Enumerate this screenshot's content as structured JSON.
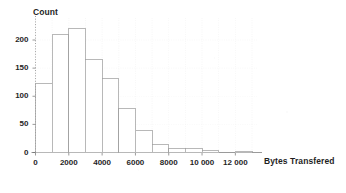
{
  "chart_data": {
    "type": "bar",
    "title": "",
    "xlabel": "Bytes Transfered",
    "ylabel": "Count",
    "bin_width": 1000,
    "grid": true,
    "legend": false,
    "xlim": [
      -600,
      13600
    ],
    "ylim": [
      0,
      232
    ],
    "bin_starts": [
      0,
      1000,
      2000,
      3000,
      4000,
      5000,
      6000,
      7000,
      8000,
      9000,
      10000,
      11000,
      12000
    ],
    "bin_ends": [
      1000,
      2000,
      3000,
      4000,
      5000,
      6000,
      7000,
      8000,
      9000,
      10000,
      11000,
      12000,
      13000
    ],
    "categories": [
      "0-1000",
      "1000-2000",
      "2000-3000",
      "3000-4000",
      "4000-5000",
      "5000-6000",
      "6000-7000",
      "7000-8000",
      "8000-9000",
      "9000-10000",
      "10000-11000",
      "11000-12000",
      "12000-13000"
    ],
    "values": [
      122,
      210,
      220,
      165,
      131,
      78,
      40,
      14,
      8,
      7,
      3,
      0,
      1
    ],
    "yticks": [
      0,
      50,
      100,
      150,
      200
    ],
    "ytick_labels": [
      "0",
      "50",
      "100",
      "150",
      "200"
    ],
    "xticks": [
      0,
      2000,
      4000,
      6000,
      8000,
      10000,
      12000
    ],
    "xtick_labels": [
      "0",
      "2000",
      "4000",
      "6000",
      "8000",
      "10 000",
      "12 000"
    ],
    "bar_fill": "#ffffff",
    "bar_stroke": "#9a9a9a",
    "axis_color": "#6e6e6e",
    "grid_color": "#d8d8d8",
    "text_color": "#1f1f1f"
  }
}
